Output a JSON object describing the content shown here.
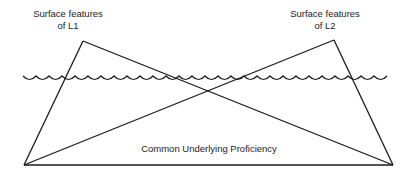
{
  "diagram": {
    "labels": {
      "l1_line1": "Surface features",
      "l1_line2": "of L1",
      "l2_line1": "Surface features",
      "l2_line2": "of L2",
      "base": "Common Underlying Proficiency"
    },
    "colors": {
      "line": "#1a1a1a",
      "text": "#222222",
      "background": "#ffffff"
    }
  }
}
